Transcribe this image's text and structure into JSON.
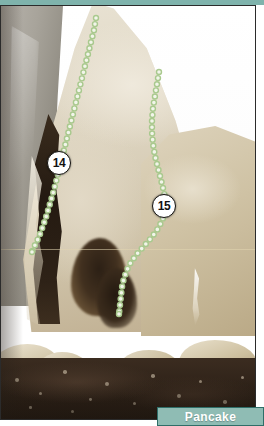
{
  "page": {
    "type": "climbing-route-topo-photo",
    "width": 264,
    "height": 426
  },
  "crag_label": {
    "name": "Pancake",
    "background_color": "#8fbcb4",
    "border_color": "#2f6e68",
    "text_color": "#ffffff"
  },
  "top_band": {
    "color": "#7fb3ac"
  },
  "photo": {
    "subject": "limestone crag face with dark crack and pocketed alcove, boulders and dark earth at the base, white sky upper right",
    "frame_border_color": "#2b2b2b",
    "rock_color": "#ddd4c0",
    "shadow_color": "#2e2217",
    "ground_color": "#2e2218"
  },
  "routes": [
    {
      "number": "14",
      "marker": {
        "x": 58,
        "y": 157
      },
      "line_color": "#a9c98e",
      "dot_fill": "#f2f5ea",
      "path": [
        [
          95,
          12
        ],
        [
          93,
          24
        ],
        [
          90,
          36
        ],
        [
          87,
          48
        ],
        [
          84,
          60
        ],
        [
          81,
          72
        ],
        [
          78,
          84
        ],
        [
          75,
          96
        ],
        [
          72,
          108
        ],
        [
          69,
          120
        ],
        [
          66,
          132
        ],
        [
          63,
          144
        ],
        [
          60,
          156
        ],
        [
          57,
          168
        ],
        [
          54,
          180
        ],
        [
          51,
          191
        ],
        [
          48,
          201
        ],
        [
          45,
          211
        ],
        [
          42,
          220
        ],
        [
          39,
          228
        ],
        [
          36,
          235
        ],
        [
          33,
          241
        ],
        [
          31,
          246
        ]
      ]
    },
    {
      "number": "15",
      "marker": {
        "x": 163,
        "y": 200
      },
      "line_color": "#a9c98e",
      "dot_fill": "#f2f5ea",
      "path": [
        [
          158,
          66
        ],
        [
          156,
          78
        ],
        [
          154,
          90
        ],
        [
          152,
          102
        ],
        [
          151,
          114
        ],
        [
          151,
          126
        ],
        [
          152,
          138
        ],
        [
          154,
          150
        ],
        [
          157,
          162
        ],
        [
          160,
          174
        ],
        [
          163,
          186
        ],
        [
          165,
          198
        ],
        [
          163,
          210
        ],
        [
          158,
          221
        ],
        [
          151,
          231
        ],
        [
          143,
          240
        ],
        [
          136,
          248
        ],
        [
          130,
          256
        ],
        [
          126,
          264
        ],
        [
          123,
          272
        ],
        [
          121,
          281
        ],
        [
          120,
          290
        ],
        [
          119,
          299
        ],
        [
          118,
          308
        ]
      ]
    }
  ]
}
